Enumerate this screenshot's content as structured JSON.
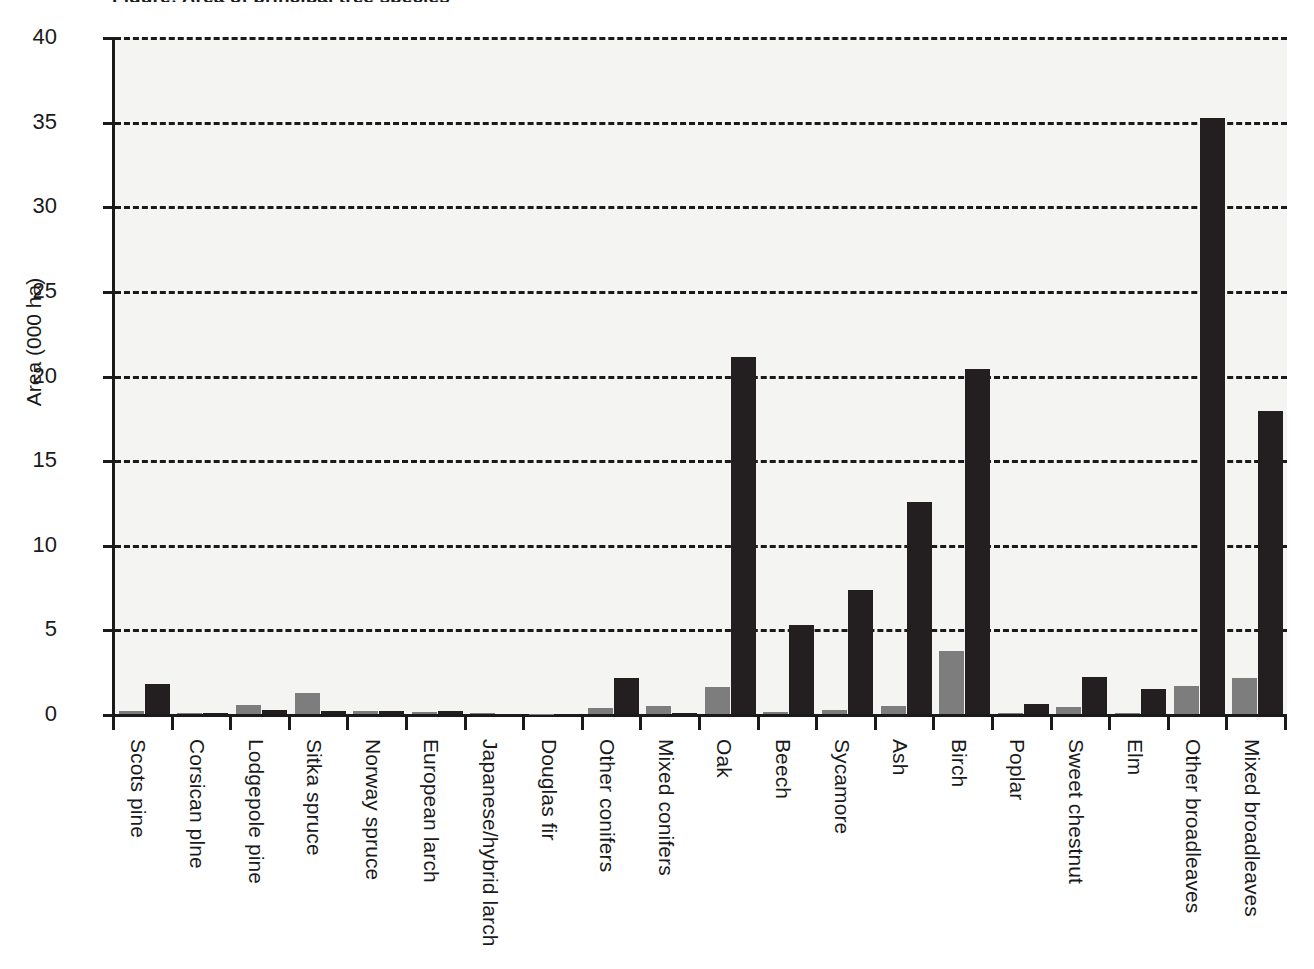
{
  "chart_data": {
    "type": "bar",
    "title": "Figure: Area of principal tree species",
    "xlabel": "",
    "ylabel": "Area (000 ha)",
    "ylim": [
      0,
      40
    ],
    "yticks": [
      0,
      5,
      10,
      15,
      20,
      25,
      30,
      35,
      40
    ],
    "grid": "horizontal-dashed",
    "legend": "none",
    "categories": [
      "Scots pine",
      "Corsican plne",
      "Lodgepole pine",
      "Sitka spruce",
      "Norway spruce",
      "European larch",
      "Japanese/hybrid larch",
      "Douglas fir",
      "Other conifers",
      "Mixed conifers",
      "Oak",
      "Beech",
      "Sycamore",
      "Ash",
      "Birch",
      "Poplar",
      "Sweet chestnut",
      "Elm",
      "Other broadleaves",
      "Mixed broadleaves"
    ],
    "series": [
      {
        "name": "light",
        "color": "#7d7d7d",
        "values": [
          0.2,
          0.05,
          0.55,
          1.25,
          0.15,
          0.1,
          0.05,
          0.02,
          0.35,
          0.45,
          1.6,
          0.1,
          0.25,
          0.5,
          3.75,
          0.05,
          0.4,
          0.05,
          1.65,
          2.15
        ]
      },
      {
        "name": "dark",
        "color": "#231f20",
        "values": [
          1.75,
          0.08,
          0.25,
          0.15,
          0.15,
          0.15,
          0.03,
          0.02,
          2.1,
          0.05,
          21.1,
          5.25,
          7.3,
          12.5,
          20.4,
          0.6,
          2.2,
          1.45,
          35.2,
          17.9
        ]
      }
    ]
  }
}
